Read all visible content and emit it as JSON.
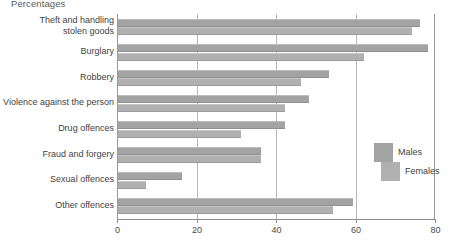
{
  "chart_data": {
    "type": "bar",
    "orientation": "horizontal",
    "title": "Percentages",
    "xlabel": "",
    "ylabel": "",
    "xlim": [
      0,
      80
    ],
    "xticks": [
      0,
      20,
      40,
      60,
      80
    ],
    "xtick_labels": [
      "0",
      "20",
      "40",
      "60",
      "80"
    ],
    "grid": true,
    "grid_axis": "x",
    "legend_position": "middle-right",
    "categories": [
      "Theft and handling\nstolen goods",
      "Burglary",
      "Robbery",
      "Violence against the person",
      "Drug offences",
      "Fraud and forgery",
      "Sexual offences",
      "Other offences"
    ],
    "series": [
      {
        "name": "Males",
        "color": "#a3a3a3",
        "values": [
          76,
          78,
          53,
          48,
          42,
          36,
          16,
          59
        ]
      },
      {
        "name": "Females",
        "color": "#b0b0b0",
        "values": [
          74,
          62,
          46,
          42,
          31,
          36,
          7,
          54
        ]
      }
    ]
  },
  "legend": {
    "items": [
      {
        "label": "Males"
      },
      {
        "label": "Females"
      }
    ]
  }
}
